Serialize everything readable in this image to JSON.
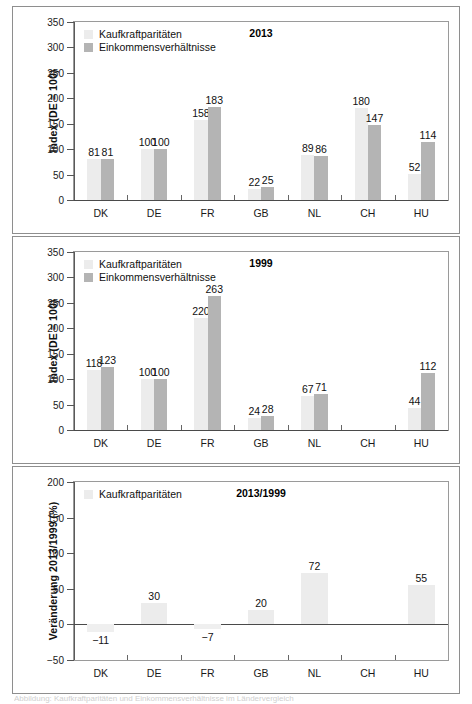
{
  "figure": {
    "width": 472,
    "height": 702,
    "caption": "Abbildung: Kaufkraftparitäten und Einkommensverhältnisse im Ländervergleich"
  },
  "colors": {
    "bar_light": "#ececec",
    "bar_dark": "#b4b4b4",
    "axis": "#5a5a5a",
    "frame": "#8e8e8e",
    "text": "#1a1a1a"
  },
  "chart_data": [
    {
      "type": "bar",
      "title": "2013",
      "xlabel": "",
      "ylabel": "Index (DE = 100)",
      "ylim": [
        0,
        350
      ],
      "yticks": [
        0,
        50,
        100,
        150,
        200,
        250,
        300,
        350
      ],
      "ytick_labels": [
        "0",
        "50",
        "100",
        "150",
        "200",
        "250",
        "300",
        "350"
      ],
      "grid": false,
      "legend_position": "top-left",
      "categories": [
        "DK",
        "DE",
        "FR",
        "GB",
        "NL",
        "CH",
        "HU"
      ],
      "series": [
        {
          "name": "Kaufkraftparitäten",
          "color": "#ececec",
          "values": [
            81,
            100,
            158,
            22,
            89,
            180,
            52
          ],
          "labels": [
            "81",
            "100",
            "158",
            "22",
            "89",
            "180",
            "52"
          ]
        },
        {
          "name": "Einkommensverhältnisse",
          "color": "#b4b4b4",
          "values": [
            81,
            100,
            183,
            25,
            86,
            147,
            114
          ],
          "labels": [
            "81",
            "100",
            "183",
            "25",
            "86",
            "147",
            "114"
          ]
        }
      ]
    },
    {
      "type": "bar",
      "title": "1999",
      "xlabel": "",
      "ylabel": "Index (DE = 100)",
      "ylim": [
        0,
        350
      ],
      "yticks": [
        0,
        50,
        100,
        150,
        200,
        250,
        300,
        350
      ],
      "ytick_labels": [
        "0",
        "50",
        "100",
        "150",
        "200",
        "250",
        "300",
        "350"
      ],
      "grid": false,
      "legend_position": "top-left",
      "categories": [
        "DK",
        "DE",
        "FR",
        "GB",
        "NL",
        "CH",
        "HU"
      ],
      "series": [
        {
          "name": "Kaufkraftparitäten",
          "color": "#ececec",
          "values": [
            118,
            100,
            220,
            24,
            67,
            null,
            44
          ],
          "labels": [
            "118",
            "100",
            "220",
            "24",
            "67",
            "",
            "44"
          ]
        },
        {
          "name": "Einkommensverhältnisse",
          "color": "#b4b4b4",
          "values": [
            123,
            100,
            263,
            28,
            71,
            null,
            112
          ],
          "labels": [
            "123",
            "100",
            "263",
            "28",
            "71",
            "",
            "112"
          ]
        }
      ]
    },
    {
      "type": "bar",
      "title": "2013/1999",
      "xlabel": "",
      "ylabel": "Veränderung 2013/1999 (%)",
      "ylim": [
        -50,
        200
      ],
      "yticks": [
        -50,
        0,
        50,
        100,
        150,
        200
      ],
      "ytick_labels": [
        "−50",
        "0",
        "50",
        "100",
        "150",
        "200"
      ],
      "grid": false,
      "legend_position": "top-left",
      "categories": [
        "DK",
        "DE",
        "FR",
        "GB",
        "NL",
        "CH",
        "HU"
      ],
      "series": [
        {
          "name": "Kaufkraftparitäten",
          "color": "#ececec",
          "values": [
            -11,
            30,
            -7,
            20,
            72,
            null,
            55
          ],
          "labels": [
            "−11",
            "30",
            "−7",
            "20",
            "72",
            "",
            "55"
          ]
        }
      ]
    }
  ]
}
